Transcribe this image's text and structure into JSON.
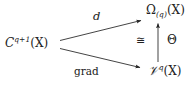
{
  "diagram": {
    "type": "commutative-diagram",
    "background_color": "#ffffff",
    "ink_color": "#222222",
    "nodes": {
      "domain": {
        "base": "C",
        "superscript": "q+1",
        "argument": "(X)",
        "full": "C^{q+1}(X)"
      },
      "omega": {
        "base": "Ω",
        "subscript": "(q)",
        "argument": "(X)",
        "full": "Ω_{(q)}(X)"
      },
      "vq": {
        "base": "𝒱",
        "superscript": "q",
        "argument": "(X)",
        "full": "𝒱^{q}(X)"
      }
    },
    "arrows": {
      "top_diagonal": {
        "label": "d",
        "from": "domain",
        "to": "omega",
        "direction": "up-right"
      },
      "bottom_diagonal": {
        "label": "grad",
        "from": "domain",
        "to": "vq",
        "direction": "down-right"
      },
      "vertical": {
        "label_right": "Θ",
        "label_left": "≅",
        "from": "vq",
        "to": "omega",
        "direction": "up"
      }
    }
  }
}
